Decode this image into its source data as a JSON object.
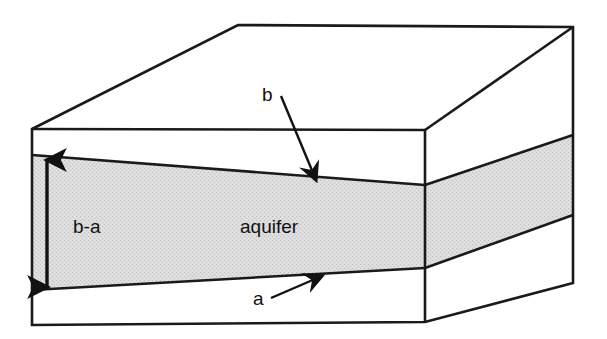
{
  "figure": {
    "type": "3d-block-diagram",
    "background_color": "#ffffff",
    "line_color": "#1a1a1a",
    "aquifer_fill_color": "#d9d9d9",
    "label_color": "#111111"
  },
  "labels": {
    "thickness": "b-a",
    "unit": "aquifer",
    "upper_surface": "b",
    "lower_surface": "a"
  },
  "annotations": {
    "thickness_arrow": "double-headed vertical arrow spanning aquifer thickness",
    "b_arrow": "leader arrow pointing to top of aquifer",
    "a_arrow": "leader arrow pointing to base of aquifer"
  },
  "geometry": {
    "front_top_left": [
      32,
      129
    ],
    "front_top_right": [
      425,
      130
    ],
    "front_bottom_left": [
      32,
      325
    ],
    "front_bottom_right": [
      425,
      322
    ],
    "back_top_left": [
      238,
      25
    ],
    "back_top_right": [
      573,
      27
    ],
    "back_bottom_right": [
      573,
      283
    ],
    "aquifer_front_top_left": [
      32,
      155
    ],
    "aquifer_front_top_right": [
      425,
      185
    ],
    "aquifer_front_bottom_left": [
      32,
      290
    ],
    "aquifer_front_bottom_right": [
      425,
      268
    ],
    "aquifer_side_top_right": [
      573,
      135
    ],
    "aquifer_side_bottom_right": [
      573,
      215
    ]
  }
}
